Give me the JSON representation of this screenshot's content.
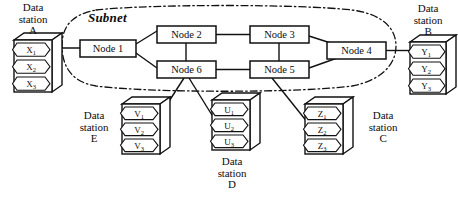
{
  "diagram": {
    "subnet_label": "Subnet",
    "stroke_color": "#111111",
    "fill_color": "#ffffff",
    "background": "#ffffff"
  },
  "nodes": [
    {
      "id": "node1",
      "label": "Node 1",
      "x": 80,
      "y": 40,
      "w": 56,
      "h": 17
    },
    {
      "id": "node2",
      "label": "Node 2",
      "x": 157,
      "y": 26,
      "w": 59,
      "h": 17
    },
    {
      "id": "node3",
      "label": "Node 3",
      "x": 250,
      "y": 26,
      "w": 59,
      "h": 17
    },
    {
      "id": "node4",
      "label": "Node 4",
      "x": 327,
      "y": 42,
      "w": 59,
      "h": 17
    },
    {
      "id": "node5",
      "label": "Node 5",
      "x": 250,
      "y": 61,
      "w": 59,
      "h": 17
    },
    {
      "id": "node6",
      "label": "Node 6",
      "x": 157,
      "y": 61,
      "w": 59,
      "h": 17
    }
  ],
  "stations": [
    {
      "id": "stationA",
      "label": "Data\nstation\nA",
      "label_position": "above",
      "cells": [
        "X",
        "X",
        "X"
      ],
      "subscripts": [
        "1",
        "2",
        "3"
      ],
      "x": 14,
      "y": 40,
      "w": 38,
      "h": 52
    },
    {
      "id": "stationB",
      "label": "Data\nstation\nB",
      "label_position": "above",
      "cells": [
        "Y",
        "Y",
        "Y"
      ],
      "subscripts": [
        "1",
        "2",
        "3"
      ],
      "x": 410,
      "y": 42,
      "w": 38,
      "h": 52
    },
    {
      "id": "stationC",
      "label": "Data\nstation\nC",
      "label_position": "right",
      "cells": [
        "Z",
        "Z",
        "Z"
      ],
      "subscripts": [
        "1",
        "2",
        "3"
      ],
      "x": 305,
      "y": 104,
      "w": 38,
      "h": 50
    },
    {
      "id": "stationD",
      "label": "Data\nstation\nD",
      "label_position": "below",
      "cells": [
        "U",
        "U",
        "U"
      ],
      "subscripts": [
        "1",
        "2",
        "3"
      ],
      "x": 212,
      "y": 100,
      "w": 38,
      "h": 50
    },
    {
      "id": "stationE",
      "label": "Data\nstation\nE",
      "label_position": "left",
      "cells": [
        "V",
        "V",
        "V"
      ],
      "subscripts": [
        "1",
        "2",
        "3"
      ],
      "x": 122,
      "y": 104,
      "w": 38,
      "h": 50
    }
  ],
  "links": [
    {
      "from": "stationA",
      "to": "node1",
      "style": "solid"
    },
    {
      "from": "node1",
      "to": "node2",
      "style": "solid"
    },
    {
      "from": "node1",
      "to": "node6",
      "style": "solid"
    },
    {
      "from": "node2",
      "to": "node3",
      "style": "solid"
    },
    {
      "from": "node2",
      "to": "node6",
      "style": "solid"
    },
    {
      "from": "node3",
      "to": "node5",
      "style": "solid"
    },
    {
      "from": "node3",
      "to": "node4",
      "style": "solid"
    },
    {
      "from": "node5",
      "to": "node4",
      "style": "solid"
    },
    {
      "from": "node6",
      "to": "node5",
      "style": "solid"
    },
    {
      "from": "node4",
      "to": "stationB",
      "style": "solid"
    },
    {
      "from": "node6",
      "to": "stationE",
      "style": "solid"
    },
    {
      "from": "node6",
      "to": "stationD",
      "style": "solid"
    },
    {
      "from": "node5",
      "to": "stationC",
      "style": "solid"
    }
  ]
}
